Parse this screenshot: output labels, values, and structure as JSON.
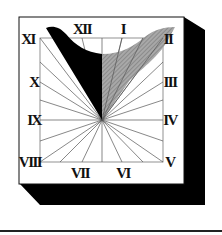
{
  "figure": {
    "type": "sundial-illustration",
    "numerals": {
      "top_left": "XI",
      "top_center_left": "XII",
      "top_center_right": "I",
      "top_right": "II",
      "left_upper": "X",
      "left_middle": "IX",
      "bottom_left": "VIII",
      "bottom_center_left": "VII",
      "bottom_center_right": "VI",
      "bottom_right": "V",
      "right_middle": "IV",
      "right_upper": "III"
    },
    "colors": {
      "face": "#ffffff",
      "shadow_block": "#000000",
      "gnomon_dark": "#000000",
      "gnomon_light": "#9a9a9a",
      "hour_lines": "#555555",
      "rule": "#222222"
    }
  }
}
